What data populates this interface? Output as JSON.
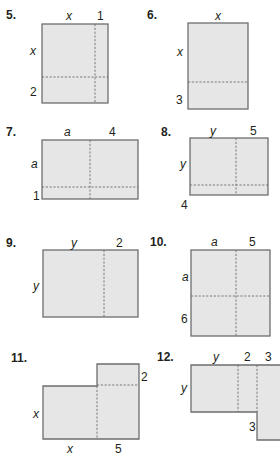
{
  "problems": [
    {
      "number": "5.",
      "top_labels": [
        "x",
        "1"
      ],
      "left_labels": [
        "x",
        "2"
      ]
    },
    {
      "number": "6.",
      "top_labels": [
        "x"
      ],
      "left_labels": [
        "x",
        "3"
      ]
    },
    {
      "number": "7.",
      "top_labels": [
        "a",
        "4"
      ],
      "left_labels": [
        "a",
        "1"
      ]
    },
    {
      "number": "8.",
      "top_labels": [
        "y",
        "5"
      ],
      "left_labels": [
        "y",
        "4"
      ]
    },
    {
      "number": "9.",
      "top_labels": [
        "y",
        "2"
      ],
      "left_labels": [
        "y"
      ]
    },
    {
      "number": "10.",
      "top_labels": [
        "a",
        "5"
      ],
      "left_labels": [
        "a",
        "6"
      ]
    },
    {
      "number": "11.",
      "bottom_labels": [
        "x",
        "5"
      ],
      "left_labels": [
        "x"
      ],
      "right_labels": [
        "2"
      ]
    },
    {
      "number": "12.",
      "top_labels": [
        "y",
        "2",
        "3"
      ],
      "left_labels": [
        "y"
      ],
      "inner_labels": [
        "3"
      ]
    }
  ],
  "colors": {
    "fill": "#e6e6e6",
    "stroke": "#6d6e71",
    "text": "#231f20"
  }
}
